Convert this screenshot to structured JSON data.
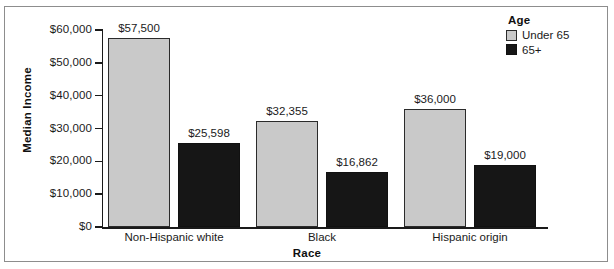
{
  "chart_data": {
    "type": "bar",
    "title": "",
    "xlabel": "Race",
    "ylabel": "Median Income",
    "categories": [
      "Non-Hispanic white",
      "Black",
      "Hispanic origin"
    ],
    "series": [
      {
        "name": "Under 65",
        "color": "#c9c9c9",
        "values": [
          57500,
          32355,
          36000
        ],
        "labels": [
          "$57,500",
          "$32,355",
          "$36,000"
        ]
      },
      {
        "name": "65+",
        "color": "#161616",
        "values": [
          25598,
          16862,
          19000
        ],
        "labels": [
          "$25,598",
          "$16,862",
          "$19,000"
        ]
      }
    ],
    "ylim": [
      0,
      60000
    ],
    "yticks": [
      0,
      10000,
      20000,
      30000,
      40000,
      50000,
      60000
    ],
    "ytick_labels": [
      "$0",
      "$10,000",
      "$20,000",
      "$30,000",
      "$40,000",
      "$50,000",
      "$60,000"
    ],
    "grid": false,
    "legend": {
      "title": "Age",
      "position": "top-right"
    }
  },
  "axes": {
    "y_title": "Median Income",
    "x_title": "Race"
  },
  "legend": {
    "title": "Age",
    "entries": [
      {
        "label": "Under 65",
        "color": "#c9c9c9"
      },
      {
        "label": "65+",
        "color": "#161616"
      }
    ]
  }
}
